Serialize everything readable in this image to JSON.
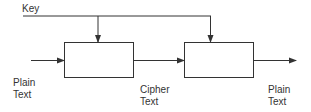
{
  "diagram": {
    "key_label": "Key",
    "input_label_line1": "Plain",
    "input_label_line2": "Text",
    "middle_label_line1": "Cipher",
    "middle_label_line2": "Text",
    "output_label_line1": "Plain",
    "output_label_line2": "Text",
    "blocks": [
      {
        "id": "encrypt-block",
        "label": ""
      },
      {
        "id": "decrypt-block",
        "label": ""
      }
    ],
    "colors": {
      "stroke": "#333333",
      "text": "#333333",
      "background": "#ffffff"
    }
  }
}
